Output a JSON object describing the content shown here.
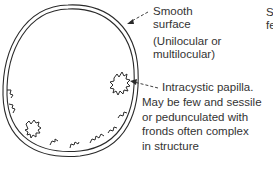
{
  "labels": {
    "smooth_line1": "Smooth",
    "smooth_line2": "surface",
    "locular_line1": "(Unilocular or",
    "locular_line2": "multilocular)",
    "papilla_line1": "Intracystic papilla.",
    "papilla_line2": "May be few and sessile",
    "papilla_line3": "or pedunculated with",
    "papilla_line4": "fronds often complex",
    "papilla_line5": "in structure",
    "cutoff_line1": "S",
    "cutoff_line2": "fe"
  },
  "colors": {
    "ink": "#2a2a2a",
    "background": "#ffffff"
  }
}
